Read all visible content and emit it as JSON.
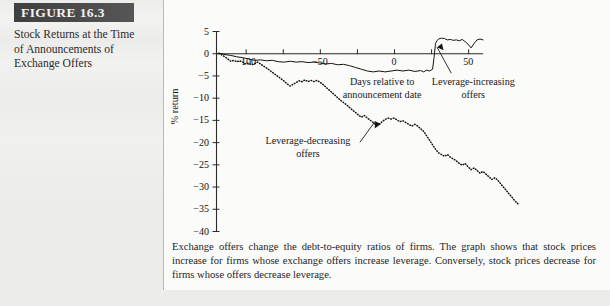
{
  "figure": {
    "banner_label": "FIGURE 16.3",
    "title": "Stock Returns at the Time of Announcements of Exchange Offers",
    "caption": "Exchange offers change the debt-to-equity ratios of firms. The graph shows that stock prices increase for firms whose exchange offers increase leverage. Conversely, stock prices decrease for firms whose offers decrease leverage."
  },
  "colors": {
    "banner_bg": "#4a4a4a",
    "banner_text": "#f2f2f2",
    "page_bg": "#ececea",
    "panel_bg": "#fbfbfa",
    "ink": "#1a1a1a",
    "divider": "#b9b9b7"
  },
  "annotations": {
    "x_axis_caption_line1": "Days relative to",
    "x_axis_caption_line2": "announcement date",
    "increasing_line1": "Leverage-increasing",
    "increasing_line2": "offers",
    "decreasing_line1": "Leverage-decreasing",
    "decreasing_line2": "offers"
  },
  "chart_data": {
    "type": "line",
    "title": "",
    "xlabel": "Days relative to announcement date",
    "ylabel": "% return",
    "xlim": [
      -120,
      60
    ],
    "ylim": [
      -40,
      5
    ],
    "xticks": [
      -100,
      -50,
      0,
      50
    ],
    "xtick_labels": [
      "-100",
      "-50",
      "0",
      "50"
    ],
    "xminor_ticks": [
      -75,
      -25,
      25
    ],
    "yticks": [
      5,
      0,
      -5,
      -10,
      -15,
      -20,
      -25,
      -30,
      -35,
      -40
    ],
    "ytick_labels": [
      "5",
      "0",
      "-5",
      "-10",
      "-15",
      "-20",
      "-25",
      "-30",
      "-35",
      "-40"
    ],
    "grid": false,
    "legend": "annotations",
    "series": [
      {
        "name": "Leverage-increasing offers",
        "style": "solid",
        "points": [
          [
            -118,
            0.0
          ],
          [
            -114,
            -0.3
          ],
          [
            -110,
            -0.5
          ],
          [
            -106,
            -0.8
          ],
          [
            -102,
            -1.0
          ],
          [
            -98,
            -1.3
          ],
          [
            -94,
            -1.6
          ],
          [
            -90,
            -1.5
          ],
          [
            -86,
            -1.7
          ],
          [
            -82,
            -1.6
          ],
          [
            -78,
            -1.9
          ],
          [
            -74,
            -2.0
          ],
          [
            -70,
            -1.8
          ],
          [
            -66,
            -2.0
          ],
          [
            -62,
            -1.9
          ],
          [
            -58,
            -2.1
          ],
          [
            -54,
            -2.0
          ],
          [
            -50,
            -2.2
          ],
          [
            -46,
            -2.4
          ],
          [
            -42,
            -2.3
          ],
          [
            -38,
            -2.6
          ],
          [
            -34,
            -2.5
          ],
          [
            -30,
            -2.8
          ],
          [
            -26,
            -3.2
          ],
          [
            -22,
            -3.6
          ],
          [
            -18,
            -4.0
          ],
          [
            -14,
            -4.2
          ],
          [
            -10,
            -4.0
          ],
          [
            -6,
            -4.2
          ],
          [
            -2,
            -4.0
          ],
          [
            2,
            -3.8
          ],
          [
            6,
            -4.0
          ],
          [
            10,
            -3.8
          ],
          [
            14,
            -4.1
          ],
          [
            18,
            -3.9
          ],
          [
            20,
            -4.2
          ],
          [
            22,
            -3.8
          ],
          [
            24,
            -4.0
          ],
          [
            26,
            -3.6
          ],
          [
            27,
            -1.0
          ],
          [
            28,
            2.2
          ],
          [
            29,
            2.8
          ],
          [
            30,
            3.2
          ],
          [
            32,
            3.4
          ],
          [
            34,
            3.3
          ],
          [
            36,
            3.0
          ],
          [
            38,
            3.1
          ],
          [
            40,
            2.9
          ],
          [
            42,
            3.0
          ],
          [
            44,
            2.8
          ],
          [
            46,
            3.1
          ],
          [
            48,
            2.6
          ],
          [
            50,
            2.0
          ],
          [
            52,
            1.2
          ],
          [
            54,
            2.2
          ],
          [
            56,
            3.0
          ],
          [
            58,
            3.2
          ],
          [
            60,
            3.0
          ]
        ]
      },
      {
        "name": "Leverage-decreasing offers",
        "style": "dotted",
        "points": [
          [
            -118,
            0.0
          ],
          [
            -116,
            -0.4
          ],
          [
            -114,
            -0.8
          ],
          [
            -112,
            -1.3
          ],
          [
            -110,
            -1.8
          ],
          [
            -108,
            -1.6
          ],
          [
            -106,
            -1.9
          ],
          [
            -104,
            -1.7
          ],
          [
            -102,
            -2.0
          ],
          [
            -100,
            -2.4
          ],
          [
            -98,
            -2.2
          ],
          [
            -96,
            -2.6
          ],
          [
            -94,
            -2.4
          ],
          [
            -92,
            -2.0
          ],
          [
            -90,
            -2.4
          ],
          [
            -88,
            -2.9
          ],
          [
            -86,
            -3.3
          ],
          [
            -84,
            -3.8
          ],
          [
            -82,
            -4.3
          ],
          [
            -80,
            -4.8
          ],
          [
            -78,
            -5.3
          ],
          [
            -76,
            -5.8
          ],
          [
            -74,
            -6.3
          ],
          [
            -72,
            -6.9
          ],
          [
            -70,
            -7.4
          ],
          [
            -68,
            -7.0
          ],
          [
            -66,
            -6.6
          ],
          [
            -64,
            -6.2
          ],
          [
            -62,
            -6.4
          ],
          [
            -60,
            -6.0
          ],
          [
            -58,
            -6.4
          ],
          [
            -56,
            -6.1
          ],
          [
            -54,
            -6.4
          ],
          [
            -52,
            -6.1
          ],
          [
            -50,
            -6.5
          ],
          [
            -48,
            -7.0
          ],
          [
            -46,
            -7.6
          ],
          [
            -44,
            -8.2
          ],
          [
            -42,
            -8.8
          ],
          [
            -40,
            -9.4
          ],
          [
            -38,
            -10.0
          ],
          [
            -36,
            -10.6
          ],
          [
            -34,
            -11.1
          ],
          [
            -32,
            -11.6
          ],
          [
            -30,
            -12.2
          ],
          [
            -28,
            -12.8
          ],
          [
            -26,
            -13.3
          ],
          [
            -24,
            -13.9
          ],
          [
            -22,
            -14.4
          ],
          [
            -20,
            -14.0
          ],
          [
            -18,
            -14.6
          ],
          [
            -16,
            -15.1
          ],
          [
            -14,
            -15.6
          ],
          [
            -12,
            -16.2
          ],
          [
            -10,
            -16.0
          ],
          [
            -8,
            -15.4
          ],
          [
            -6,
            -14.9
          ],
          [
            -4,
            -14.6
          ],
          [
            -2,
            -14.8
          ],
          [
            0,
            -14.6
          ],
          [
            2,
            -15.0
          ],
          [
            4,
            -15.4
          ],
          [
            6,
            -15.2
          ],
          [
            8,
            -15.6
          ],
          [
            10,
            -16.0
          ],
          [
            12,
            -16.4
          ],
          [
            14,
            -16.0
          ],
          [
            16,
            -16.4
          ],
          [
            18,
            -17.0
          ],
          [
            20,
            -17.6
          ],
          [
            22,
            -18.6
          ],
          [
            24,
            -19.6
          ],
          [
            26,
            -20.6
          ],
          [
            28,
            -21.6
          ],
          [
            30,
            -22.4
          ],
          [
            32,
            -22.8
          ],
          [
            34,
            -23.2
          ],
          [
            36,
            -22.8
          ],
          [
            38,
            -23.4
          ],
          [
            40,
            -23.8
          ],
          [
            42,
            -24.2
          ],
          [
            44,
            -24.8
          ],
          [
            46,
            -25.2
          ],
          [
            48,
            -24.8
          ],
          [
            50,
            -25.6
          ],
          [
            52,
            -26.2
          ],
          [
            54,
            -25.8
          ],
          [
            56,
            -26.4
          ],
          [
            58,
            -27.0
          ],
          [
            60,
            -26.6
          ],
          [
            62,
            -27.2
          ],
          [
            64,
            -27.8
          ],
          [
            66,
            -28.4
          ],
          [
            68,
            -28.0
          ],
          [
            70,
            -28.6
          ],
          [
            72,
            -29.4
          ],
          [
            74,
            -30.2
          ],
          [
            76,
            -31.0
          ],
          [
            78,
            -31.8
          ],
          [
            80,
            -32.6
          ],
          [
            82,
            -33.4
          ],
          [
            84,
            -34.0
          ]
        ]
      }
    ]
  }
}
